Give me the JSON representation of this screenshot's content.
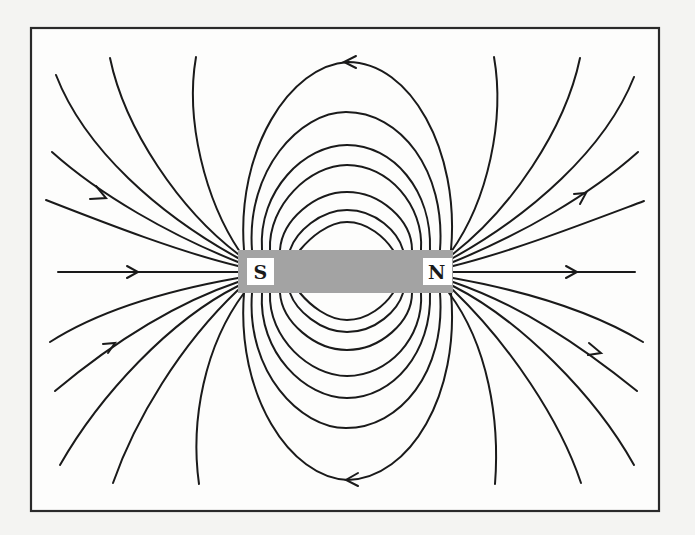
{
  "figure": {
    "magnet": {
      "south_label": "S",
      "north_label": "N",
      "color": "#a3a3a3"
    },
    "colors": {
      "line": "#1a1a1a",
      "frame": "#2a2a2a",
      "background": "#fdfdfc",
      "page": "#f4f4f2"
    },
    "field_line_direction": "Out of N, into S (arrows point away from N outside the magnet)"
  }
}
